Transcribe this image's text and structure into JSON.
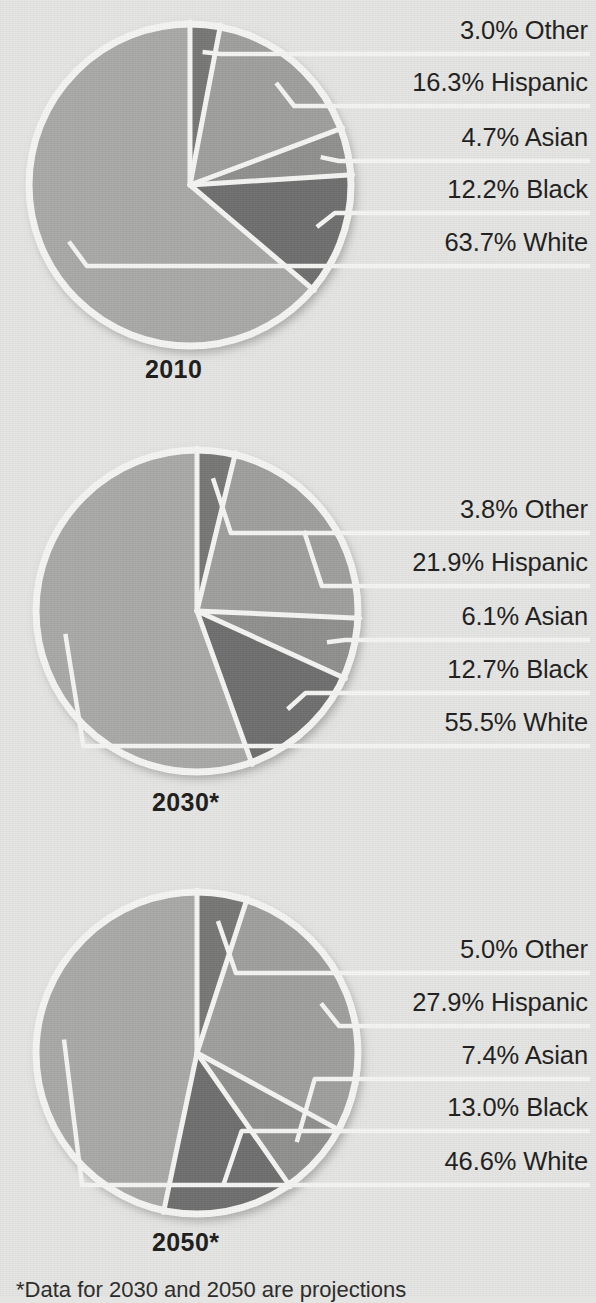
{
  "figure": {
    "background_color": "#e4e4e2",
    "footnote": "*Data for 2030 and 2050 are projections"
  },
  "palette": {
    "white_slice": "#a8a8a6",
    "black_slice": "#6e6e6e",
    "asian_slice": "#8f8f8d",
    "hispanic_slice": "#9e9e9c",
    "other_slice": "#767674",
    "separator": "#f4f4f2",
    "text": "#1d1d1d"
  },
  "chart_data": {
    "type": "pie",
    "title": "",
    "subtitle": "",
    "xlabel": "",
    "ylabel": "",
    "legend_position": "callout-right",
    "grid": false,
    "note": "*Data for 2030 and 2050 are projections",
    "categories": [
      "White",
      "Black",
      "Asian",
      "Hispanic",
      "Other"
    ],
    "charts": [
      {
        "id": "pie-2010",
        "year_label": "2010",
        "center": {
          "x": 190,
          "y": 185
        },
        "radius": 163,
        "slices": [
          {
            "label": "Other",
            "value": 3.0,
            "text": "3.0% Other",
            "color": "#767674"
          },
          {
            "label": "Hispanic",
            "value": 16.3,
            "text": "16.3% Hispanic",
            "color": "#9e9e9c"
          },
          {
            "label": "Asian",
            "value": 4.7,
            "text": "4.7% Asian",
            "color": "#8f8f8d"
          },
          {
            "label": "Black",
            "value": 12.2,
            "text": "12.2% Black",
            "color": "#6e6e6e"
          },
          {
            "label": "White",
            "value": 63.7,
            "text": "63.7% White",
            "color": "#a8a8a6"
          }
        ]
      },
      {
        "id": "pie-2030",
        "year_label": "2030*",
        "center": {
          "x": 197,
          "y": 611
        },
        "radius": 163,
        "slices": [
          {
            "label": "Other",
            "value": 3.8,
            "text": "3.8% Other",
            "color": "#767674"
          },
          {
            "label": "Hispanic",
            "value": 21.9,
            "text": "21.9% Hispanic",
            "color": "#9e9e9c"
          },
          {
            "label": "Asian",
            "value": 6.1,
            "text": "6.1% Asian",
            "color": "#8f8f8d"
          },
          {
            "label": "Black",
            "value": 12.7,
            "text": "12.7% Black",
            "color": "#6e6e6e"
          },
          {
            "label": "White",
            "value": 55.5,
            "text": "55.5% White",
            "color": "#a8a8a6"
          }
        ]
      },
      {
        "id": "pie-2050",
        "year_label": "2050*",
        "center": {
          "x": 197,
          "y": 1053
        },
        "radius": 163,
        "slices": [
          {
            "label": "Other",
            "value": 5.0,
            "text": "5.0% Other",
            "color": "#767674"
          },
          {
            "label": "Hispanic",
            "value": 27.9,
            "text": "27.9% Hispanic",
            "color": "#9e9e9c"
          },
          {
            "label": "Asian",
            "value": 7.4,
            "text": "7.4% Asian",
            "color": "#8f8f8d"
          },
          {
            "label": "Black",
            "value": 13.0,
            "text": "13.0% Black",
            "color": "#6e6e6e"
          },
          {
            "label": "White",
            "value": 46.6,
            "text": "46.6% White",
            "color": "#a8a8a6"
          }
        ]
      }
    ]
  },
  "charts_ui": [
    {
      "year": "2010",
      "labels": [
        "3.0% Other",
        "16.3% Hispanic",
        "4.7% Asian",
        "12.2% Black",
        "63.7% White"
      ],
      "label_tops": [
        16,
        68,
        123,
        175,
        228
      ],
      "year_top": 355,
      "year_left": 145
    },
    {
      "year": "2030*",
      "labels": [
        "3.8% Other",
        "21.9% Hispanic",
        "6.1% Asian",
        "12.7% Black",
        "55.5% White"
      ],
      "label_tops": [
        495,
        548,
        602,
        655,
        708
      ],
      "year_top": 788,
      "year_left": 152
    },
    {
      "year": "2050*",
      "labels": [
        "5.0% Other",
        "27.9% Hispanic",
        "7.4% Asian",
        "13.0% Black",
        "46.6% White"
      ],
      "label_tops": [
        935,
        988,
        1041,
        1093,
        1147
      ],
      "year_top": 1228,
      "year_left": 152
    }
  ]
}
